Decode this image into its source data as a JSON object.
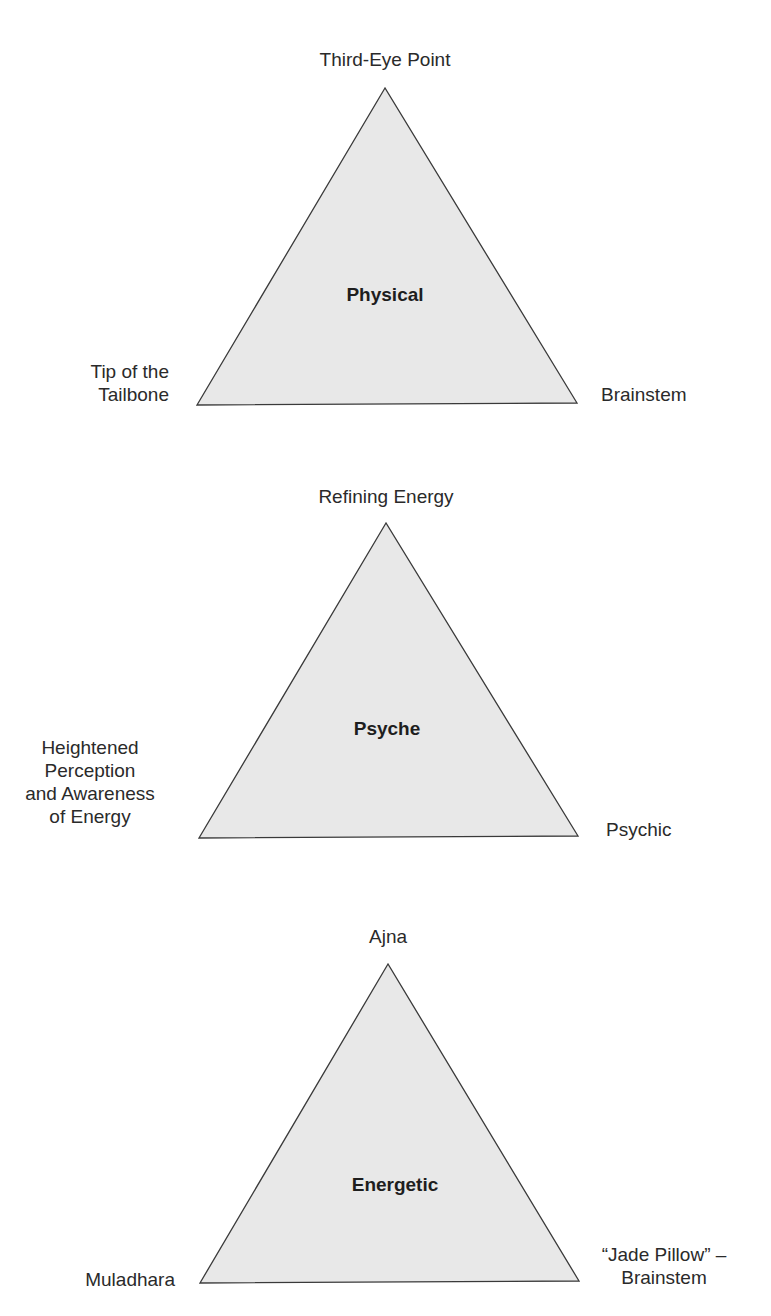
{
  "diagram": {
    "colors": {
      "triangle_fill": "#e8e8e8",
      "triangle_stroke": "#3a3a3a",
      "text": "#2a2a2a",
      "background": "#ffffff"
    },
    "triangles": [
      {
        "center_label": "Physical",
        "top_label": "Third-Eye Point",
        "left_label": [
          "Tip of the",
          "Tailbone"
        ],
        "right_label": [
          "Brainstem"
        ],
        "points": "385,88 197,405 577,403"
      },
      {
        "center_label": "Psyche",
        "top_label": "Refining Energy",
        "left_label": [
          "Heightened",
          "Perception",
          "and Awareness",
          "of Energy"
        ],
        "right_label": [
          "Psychic"
        ],
        "points": "386,523 199,838 578,836"
      },
      {
        "center_label": "Energetic",
        "top_label": "Ajna",
        "left_label": [
          "Muladhara"
        ],
        "right_label": [
          "“Jade Pillow” –",
          "Brainstem"
        ],
        "points": "388,964 200,1283 579,1281"
      }
    ]
  }
}
